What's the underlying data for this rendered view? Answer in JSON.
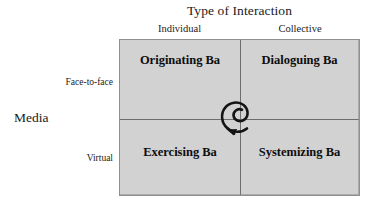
{
  "diagram": {
    "x_axis_title": "Type of Interaction",
    "y_axis_title": "Media",
    "column_headers": [
      {
        "key": "individual",
        "label": "Individual"
      },
      {
        "key": "collective",
        "label": "Collective"
      }
    ],
    "row_headers": [
      {
        "key": "face-to-face",
        "label": "Face-to-face"
      },
      {
        "key": "virtual",
        "label": "Virtual"
      }
    ],
    "quadrants": [
      {
        "key": "originating",
        "label": "Originating Ba",
        "row": "face-to-face",
        "column": "individual"
      },
      {
        "key": "dialoguing",
        "label": "Dialoguing Ba",
        "row": "face-to-face",
        "column": "collective"
      },
      {
        "key": "exercising",
        "label": "Exercising Ba",
        "row": "virtual",
        "column": "individual"
      },
      {
        "key": "systemizing",
        "label": "Systemizing Ba",
        "row": "virtual",
        "column": "collective"
      }
    ],
    "center_icon": "spiral-arrow-icon",
    "colors": {
      "quadrant_fill": "#d2d2d2",
      "border": "#8f8f8f",
      "divider": "#6e6e6e",
      "text": "#1a1a1a",
      "background": "#ffffff"
    }
  }
}
